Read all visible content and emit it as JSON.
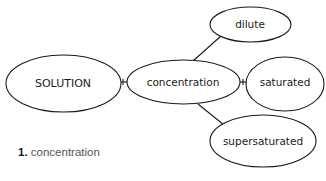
{
  "diagram": {
    "type": "concept-map",
    "nodes": [
      {
        "id": "solution",
        "label": "SOLUTION"
      },
      {
        "id": "concentration",
        "label": "concentration"
      },
      {
        "id": "dilute",
        "label": "dilute"
      },
      {
        "id": "saturated",
        "label": "saturated"
      },
      {
        "id": "supersaturated",
        "label": "supersaturated"
      }
    ],
    "edges": [
      {
        "from": "solution",
        "to": "concentration"
      },
      {
        "from": "concentration",
        "to": "dilute"
      },
      {
        "from": "concentration",
        "to": "saturated"
      },
      {
        "from": "concentration",
        "to": "supersaturated"
      }
    ]
  },
  "caption": {
    "number": "1.",
    "text": "concentration"
  }
}
